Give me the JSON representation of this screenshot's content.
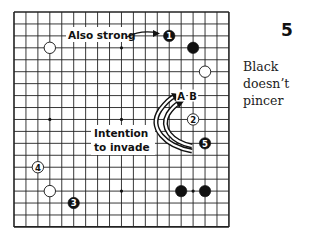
{
  "diagram": {
    "number": "5",
    "caption": "Black doesn’t pincer",
    "board": {
      "size": 19,
      "star_points": [
        [
          3,
          3
        ],
        [
          9,
          3
        ],
        [
          15,
          3
        ],
        [
          3,
          9
        ],
        [
          9,
          9
        ],
        [
          15,
          9
        ],
        [
          3,
          15
        ],
        [
          9,
          15
        ],
        [
          15,
          15
        ]
      ],
      "stones": [
        {
          "color": "white",
          "col": 3,
          "row": 3,
          "label": ""
        },
        {
          "color": "black",
          "col": 13,
          "row": 2,
          "label": "1"
        },
        {
          "color": "black",
          "col": 15,
          "row": 3,
          "label": ""
        },
        {
          "color": "white",
          "col": 16,
          "row": 5,
          "label": ""
        },
        {
          "color": "white",
          "col": 15,
          "row": 9,
          "label": "2"
        },
        {
          "color": "black",
          "col": 16,
          "row": 11,
          "label": "5"
        },
        {
          "color": "white",
          "col": 2,
          "row": 13,
          "label": "4"
        },
        {
          "color": "white",
          "col": 3,
          "row": 15,
          "label": ""
        },
        {
          "color": "black",
          "col": 5,
          "row": 16,
          "label": "3"
        },
        {
          "color": "black",
          "col": 14,
          "row": 15,
          "label": ""
        },
        {
          "color": "black",
          "col": 16,
          "row": 15,
          "label": ""
        }
      ],
      "markers": [
        {
          "col": 14,
          "row": 7,
          "label": "A"
        },
        {
          "col": 15,
          "row": 7,
          "label": "B"
        }
      ]
    },
    "annotations": {
      "also_strong": "Also strong",
      "intention_line1": "Intention",
      "intention_line2": "to invade"
    }
  }
}
